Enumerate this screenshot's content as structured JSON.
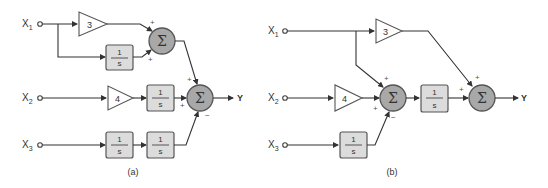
{
  "figure": {
    "panels": [
      {
        "caption": "(a)",
        "inputs": [
          {
            "name": "X",
            "sub": "1"
          },
          {
            "name": "X",
            "sub": "2"
          },
          {
            "name": "X",
            "sub": "3"
          }
        ],
        "gains": [
          "3",
          "4"
        ],
        "integrator": {
          "num": "1",
          "den": "s"
        },
        "sum_symbol": "Σ",
        "output": "Y",
        "signs": {
          "sum1_top": "+",
          "sum1_bottom": "+",
          "sum2_top": "+",
          "sum2_left": "+",
          "sum2_bottom": "−"
        }
      },
      {
        "caption": "(b)",
        "inputs": [
          {
            "name": "X",
            "sub": "1"
          },
          {
            "name": "X",
            "sub": "2"
          },
          {
            "name": "X",
            "sub": "3"
          }
        ],
        "gains": [
          "3",
          "4"
        ],
        "integrator": {
          "num": "1",
          "den": "s"
        },
        "sum_symbol": "Σ",
        "output": "Y",
        "signs": {
          "sum1_top": "+",
          "sum1_left": "+",
          "sum1_bottom": "−",
          "sum2_top": "+",
          "sum2_left": "+"
        }
      }
    ]
  }
}
